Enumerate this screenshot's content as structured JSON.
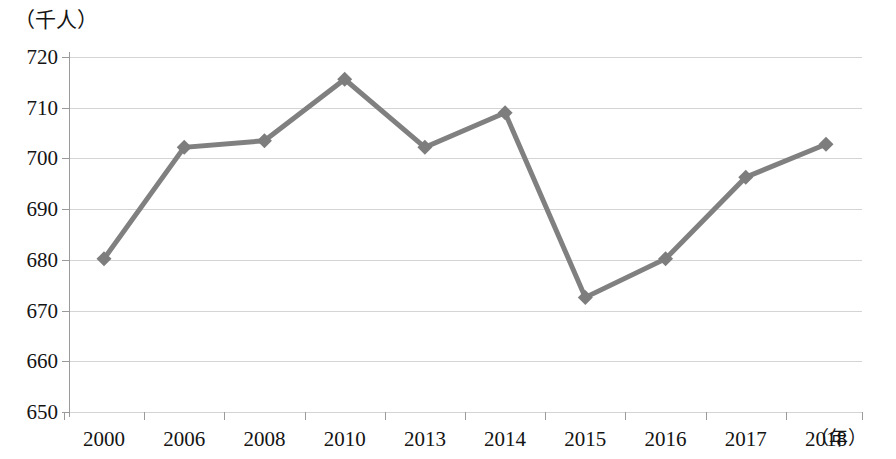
{
  "chart_data": {
    "type": "line",
    "title": "",
    "subtitle": "",
    "xlabel": "（年）",
    "ylabel": "（千人）",
    "categories": [
      "2000",
      "2006",
      "2008",
      "2010",
      "2013",
      "2014",
      "2015",
      "2016",
      "2017",
      "2018"
    ],
    "values": [
      680.2,
      702.2,
      703.5,
      715.6,
      702.2,
      709.0,
      672.6,
      680.2,
      696.3,
      702.8
    ],
    "series": [
      {
        "name": "",
        "values": [
          680.2,
          702.2,
          703.5,
          715.6,
          702.2,
          709.0,
          672.6,
          680.2,
          696.3,
          702.8
        ]
      }
    ],
    "ylim": [
      650,
      720
    ],
    "y_ticks": [
      650,
      660,
      670,
      680,
      690,
      700,
      710,
      720
    ],
    "y_tick_labels": [
      "650",
      "660",
      "670",
      "680",
      "690",
      "700",
      "710",
      "720"
    ],
    "x_tick_labels": [
      "2000",
      "2006",
      "2008",
      "2010",
      "2013",
      "2014",
      "2015",
      "2016",
      "2017",
      "2018"
    ],
    "grid": true,
    "legend": "none",
    "marker": "diamond",
    "line_color": "#808080",
    "marker_color": "#7d7d7d",
    "grid_color": "#d4d4d4",
    "axis_color": "#9a9a9a",
    "line_width": 5
  },
  "axis": {
    "y_unit_caption": "（千人）",
    "x_unit_caption": "（年）"
  }
}
